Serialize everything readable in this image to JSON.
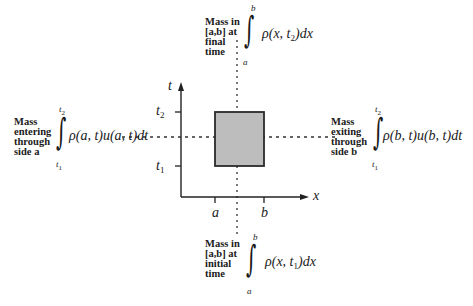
{
  "diagram": {
    "axes": {
      "x_label": "x",
      "y_label": "t",
      "x_ticks": [
        "a",
        "b"
      ],
      "y_ticks": [
        {
          "base": "t",
          "sub": "1"
        },
        {
          "base": "t",
          "sub": "2"
        }
      ]
    },
    "region": {
      "description": "shaded rectangle [a,b] x [t1,t2]",
      "fill": "#bdbdbd",
      "stroke": "#333333"
    },
    "annotations": {
      "top": {
        "label": "Mass in\n[a,b] at\nfinal\ntime",
        "lower_limit": "a",
        "upper_limit": "b",
        "integrand": "ρ(x, t",
        "integrand_sub": "2",
        "integrand_end": ")dx"
      },
      "bottom": {
        "label": "Mass in\n[a,b] at\ninitial\ntime",
        "lower_limit": "a",
        "upper_limit": "b",
        "integrand": "ρ(x, t",
        "integrand_sub": "1",
        "integrand_end": ")dx"
      },
      "left": {
        "label": "Mass\nentering\nthrough\nside a",
        "lower_limit": "t",
        "lower_limit_sub": "1",
        "upper_limit": "t",
        "upper_limit_sub": "2",
        "integrand": "ρ(a, t)u(a, t)dt"
      },
      "right": {
        "label": "Mass\nexiting\nthrough\nside b",
        "lower_limit": "t",
        "lower_limit_sub": "1",
        "upper_limit": "t",
        "upper_limit_sub": "2",
        "integrand": "ρ(b, t)u(b, t)dt"
      }
    }
  }
}
